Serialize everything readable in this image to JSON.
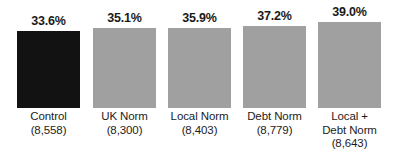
{
  "chart_data": {
    "type": "bar",
    "title": "",
    "subtitle": "",
    "xlabel": "",
    "ylabel": "",
    "ylim": [
      0,
      42
    ],
    "grid": false,
    "legend": null,
    "categories": [
      "Control",
      "UK Norm",
      "Local Norm",
      "Debt Norm",
      "Local + Debt Norm"
    ],
    "values": [
      33.6,
      35.1,
      35.9,
      37.2,
      39.0
    ],
    "value_labels": [
      "33.6%",
      "35.1%",
      "35.9%",
      "37.2%",
      "39.0%"
    ],
    "sample_sizes": [
      8558,
      8300,
      8403,
      8779,
      8643
    ],
    "sample_size_labels": [
      "(8,558)",
      "(8,300)",
      "(8,403)",
      "(8,779)",
      "(8,643)"
    ],
    "bar_colors": [
      "#121212",
      "#a0a0a0",
      "#a0a0a0",
      "#a0a0a0",
      "#a0a0a0"
    ]
  },
  "bars": [
    {
      "value_label": "33.6%",
      "category_lines": [
        "Control",
        "(8,558)"
      ],
      "left": 17,
      "top": 31,
      "dark": true
    },
    {
      "value_label": "35.1%",
      "category_lines": [
        "UK Norm",
        "(8,300)"
      ],
      "left": 93,
      "top": 28,
      "dark": false
    },
    {
      "value_label": "35.9%",
      "category_lines": [
        "Local Norm",
        "(8,403)"
      ],
      "left": 168,
      "top": 28,
      "dark": false
    },
    {
      "value_label": "37.2%",
      "category_lines": [
        "Debt Norm",
        "(8,779)"
      ],
      "left": 243,
      "top": 26,
      "dark": false
    },
    {
      "value_label": "39.0%",
      "category_lines": [
        "Local +",
        "Debt Norm",
        "(8,643)"
      ],
      "left": 318,
      "top": 22,
      "dark": false
    }
  ],
  "geometry": {
    "baseline_y": 108,
    "bar_width": 63
  }
}
